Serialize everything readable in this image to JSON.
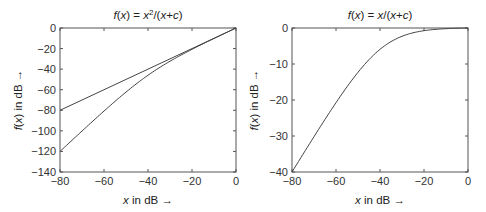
{
  "chart_data": [
    {
      "type": "line",
      "title": "f(x) = x²/(x+c)",
      "title_parts": {
        "pre": "f",
        "paren": "(x) = x",
        "sup": "2",
        "post": "/(x+c)"
      },
      "xlabel": "x in dB →",
      "ylabel": "f(x) in dB →",
      "xlim": [
        -80,
        0
      ],
      "ylim": [
        -140,
        0
      ],
      "xticks": [
        -80,
        -60,
        -40,
        -20,
        0
      ],
      "yticks": [
        0,
        -20,
        -40,
        -60,
        -80,
        -100,
        -120,
        -140
      ],
      "grid": false,
      "series": [
        {
          "name": "f(x) = x (reference)",
          "x": [
            -80,
            -60,
            -40,
            -20,
            0
          ],
          "y": [
            -80,
            -60,
            -40,
            -20,
            0
          ]
        },
        {
          "name": "f(x) = x²/(x+c)",
          "x": [
            -80,
            -70,
            -60,
            -50,
            -40,
            -30,
            -20,
            -10,
            0
          ],
          "y": [
            -120,
            -110.4,
            -100.8,
            -72,
            -46,
            -31.5,
            -20.8,
            -10.3,
            0
          ]
        }
      ]
    },
    {
      "type": "line",
      "title": "f(x) = x/(x+c)",
      "xlabel": "x in dB →",
      "ylabel": "f(x) in dB →",
      "xlim": [
        -80,
        0
      ],
      "ylim": [
        -40,
        0
      ],
      "xticks": [
        -80,
        -60,
        -40,
        -20,
        0
      ],
      "yticks": [
        0,
        -10,
        -20,
        -30,
        -40
      ],
      "grid": false,
      "series": [
        {
          "name": "f(x) = x/(x+c)",
          "x": [
            -80,
            -70,
            -60,
            -50,
            -40,
            -30,
            -20,
            -10,
            0
          ],
          "y": [
            -40,
            -30,
            -20.8,
            -12.4,
            -6,
            -2.4,
            -0.8,
            -0.3,
            0
          ]
        }
      ]
    }
  ],
  "labels": {
    "left_title_f": "f",
    "left_title_rest": "(x) = x",
    "left_title_sup": "2",
    "left_title_tail": "/(x+c)",
    "right_title": "f(x) = x/(x+c)",
    "xlabel": "x in dB →",
    "ylabel": "f(x) in dB →"
  }
}
